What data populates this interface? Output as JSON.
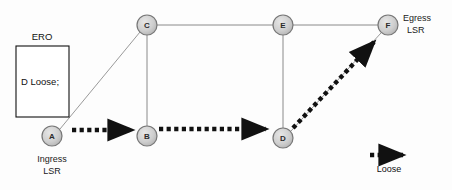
{
  "diagram": {
    "background_color": "#fdfdfd",
    "nodes": [
      {
        "id": "A",
        "label": "A",
        "cx": 52,
        "cy": 136,
        "r": 10,
        "fill": "#cccccc",
        "stroke": "#777777"
      },
      {
        "id": "B",
        "label": "B",
        "cx": 147,
        "cy": 136,
        "r": 10,
        "fill": "#cccccc",
        "stroke": "#777777"
      },
      {
        "id": "C",
        "label": "C",
        "cx": 147,
        "cy": 25,
        "r": 10,
        "fill": "#cccccc",
        "stroke": "#777777"
      },
      {
        "id": "D",
        "label": "D",
        "cx": 283,
        "cy": 138,
        "r": 10,
        "fill": "#cccccc",
        "stroke": "#777777"
      },
      {
        "id": "E",
        "label": "E",
        "cx": 283,
        "cy": 25,
        "r": 10,
        "fill": "#cccccc",
        "stroke": "#777777"
      },
      {
        "id": "F",
        "label": "F",
        "cx": 388,
        "cy": 25,
        "r": 10,
        "fill": "#cccccc",
        "stroke": "#777777"
      }
    ],
    "links": [
      {
        "from": "A",
        "to": "C",
        "x1": 60,
        "y1": 129,
        "x2": 140,
        "y2": 32,
        "color": "#9a9a9a"
      },
      {
        "from": "C",
        "to": "E",
        "x1": 157,
        "y1": 25,
        "x2": 273,
        "y2": 25,
        "color": "#8a8a8a"
      },
      {
        "from": "E",
        "to": "F",
        "x1": 293,
        "y1": 25,
        "x2": 378,
        "y2": 25,
        "color": "#8a8a8a"
      },
      {
        "from": "C",
        "to": "B",
        "x1": 147,
        "y1": 35,
        "x2": 147,
        "y2": 126,
        "color": "#8a8a8a"
      },
      {
        "from": "E",
        "to": "D",
        "x1": 283,
        "y1": 35,
        "x2": 283,
        "y2": 128,
        "color": "#8a8a8a"
      },
      {
        "from": "D",
        "to": "F",
        "x1": 291,
        "y1": 131,
        "x2": 381,
        "y2": 33,
        "color": "#9a9a9a"
      }
    ],
    "lsp_path": [
      {
        "from": "A",
        "to": "B",
        "x1": 72,
        "y1": 130,
        "x2": 137,
        "y2": 130,
        "color": "#111111"
      },
      {
        "from": "B",
        "to": "D",
        "x1": 159,
        "y1": 129,
        "x2": 271,
        "y2": 129,
        "color": "#111111"
      },
      {
        "from": "D",
        "to": "F",
        "x1": 293,
        "y1": 128,
        "x2": 378,
        "y2": 38,
        "color": "#111111"
      }
    ],
    "ero_box": {
      "title": "ERO",
      "entry": "D Loose;",
      "x": 16,
      "y": 46,
      "width": 53,
      "height": 71,
      "stroke": "#111111",
      "fill": "#ffffff"
    },
    "node_labels": [
      {
        "for": "A",
        "line1": "Ingress",
        "line2": "LSR",
        "x": 52,
        "y": 159,
        "align": "middle"
      },
      {
        "for": "F",
        "line1": "Egress",
        "line2": "LSR",
        "x": 403,
        "y": 21,
        "align": "start"
      }
    ],
    "legend": {
      "label": "Loose",
      "arrow_x1": 370,
      "arrow_x2": 408,
      "arrow_y": 155,
      "text_x": 389,
      "text_y": 171,
      "color": "#111111"
    }
  }
}
